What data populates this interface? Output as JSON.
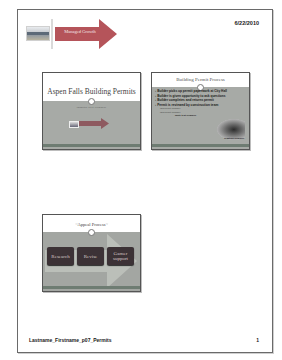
{
  "page": {
    "date": "6/22/2010",
    "footer_text": "Lastname_Firstname_p07_Permits",
    "page_number": "1"
  },
  "header": {
    "arrow_label": "Managed Growth",
    "arrow_label_note": "illegible at source resolution; approximate reading",
    "arrow_color": "#b5545a"
  },
  "slides": [
    {
      "title": "Aspen Falls Building Permits",
      "subtitle": "[subtitle text illegible]",
      "subtitle_note": "placeholder; not readable in screenshot"
    },
    {
      "title": "Building Permit Process",
      "bullets": [
        "Builder picks up permit paperwork at City Hall",
        "Builder is given opportunity to ask questions",
        "Builder completes and returns permit",
        "Permit is reviewed by construction team"
      ],
      "sub_bullets": [
        "[sub-bullet illegible]",
        "[sub-bullet illegible]"
      ],
      "sub_bullets_note": "placeholders; not readable in screenshot",
      "note": "[note text illegible]",
      "caption": "[caption illegible]",
      "caption_note": "placeholder; not readable in screenshot"
    },
    {
      "title": "~Appeal Process~",
      "steps": [
        "Research",
        "Revise",
        "Garner support"
      ]
    }
  ],
  "colors": {
    "band_gray": "#a7aaa6",
    "step_box": "#3c3236",
    "bottom_bar": "#6e7c72"
  }
}
